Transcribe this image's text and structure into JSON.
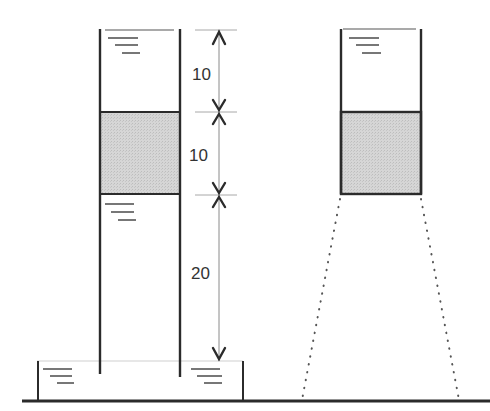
{
  "diagram": {
    "type": "hydrostatics-tube-comparison",
    "colors": {
      "stroke": "#2b2b2b",
      "fill_block": "#d4d4d4",
      "dim_line": "#8a8a8a",
      "label": "#333333",
      "background": "#ffffff"
    },
    "dimensions": [
      {
        "id": "top-water-column",
        "label": "10",
        "y_top": 30,
        "y_bottom": 112
      },
      {
        "id": "block-height",
        "label": "10",
        "y_top": 112,
        "y_bottom": 194
      },
      {
        "id": "lower-water-column",
        "label": "20",
        "y_top": 194,
        "y_bottom": 361
      }
    ],
    "left_tube": {
      "x_left": 100,
      "x_right": 180,
      "y_top": 30,
      "y_bottom": 376,
      "block": {
        "y_top": 112,
        "y_bottom": 194
      },
      "water_symbols": [
        {
          "x": 106,
          "y": 37
        },
        {
          "x": 106,
          "y": 203
        }
      ]
    },
    "basin": {
      "x_left": 37,
      "x_right": 243,
      "wall_top": 361,
      "floor": 401,
      "water_symbols": [
        {
          "x": 43,
          "y": 368
        },
        {
          "x": 191,
          "y": 368
        }
      ]
    },
    "right_tube": {
      "x_left": 341,
      "x_right": 421,
      "y_top": 29,
      "y_bottom": 194,
      "block": {
        "y_top": 112,
        "y_bottom": 194
      },
      "water_symbols": [
        {
          "x": 348,
          "y": 37
        }
      ],
      "dotted_flare": {
        "left_bottom_x": 302,
        "right_bottom_x": 459,
        "bottom_y": 401
      }
    },
    "ground": {
      "x_start": 22,
      "x_end": 490,
      "y": 401
    }
  }
}
